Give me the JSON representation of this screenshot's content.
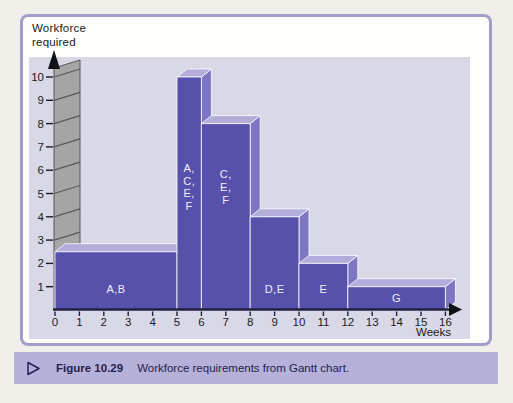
{
  "colors": {
    "page_bg": "#f1efe9",
    "card_bg": "#fdfdfb",
    "card_border": "#a29dca",
    "plot_bg": "#d9d8e7",
    "bar_front": "#5851ac",
    "bar_top": "#b2adda",
    "bar_side": "#7d76c3",
    "bar_label": "#f0eefc",
    "axis_line": "#21203f",
    "text": "#1b1b22",
    "wall_fill": "#a5a5a6",
    "wall_line": "#59595c",
    "caption_band_bg": "#b6b1d8",
    "caption_text": "#232250"
  },
  "chart": {
    "y_axis_title_line1": "Workforce",
    "y_axis_title_line2": "required"
  },
  "chart_data": {
    "type": "bar",
    "style": "3d-stepped-histogram",
    "title": "Workforce requirements from Gantt chart",
    "xlabel": "Weeks",
    "ylabel": "Workforce required",
    "xlim": [
      0,
      16
    ],
    "ylim": [
      0,
      10
    ],
    "x_ticks": [
      0,
      1,
      2,
      3,
      4,
      5,
      6,
      7,
      8,
      9,
      10,
      11,
      12,
      13,
      14,
      15,
      16
    ],
    "y_ticks": [
      1,
      2,
      3,
      4,
      5,
      6,
      7,
      8,
      9,
      10
    ],
    "grid": false,
    "legend": "none",
    "bars": [
      {
        "activities": "A,B",
        "start_week": 0,
        "end_week": 5,
        "workforce": 2.5,
        "label_layout": "inline"
      },
      {
        "activities": "A, C, E, F",
        "start_week": 5,
        "end_week": 6,
        "workforce": 10,
        "label_layout": "stacked"
      },
      {
        "activities": "C, E, F",
        "start_week": 6,
        "end_week": 8,
        "workforce": 8,
        "label_layout": "stacked"
      },
      {
        "activities": "D,E",
        "start_week": 8,
        "end_week": 10,
        "workforce": 4,
        "label_layout": "inline"
      },
      {
        "activities": "E",
        "start_week": 10,
        "end_week": 12,
        "workforce": 2,
        "label_layout": "inline"
      },
      {
        "activities": "G",
        "start_week": 12,
        "end_week": 16,
        "workforce": 1,
        "label_layout": "inline"
      }
    ]
  },
  "caption": {
    "marker": "triangle-right",
    "figure_label": "Figure 10.29",
    "text": "Workforce requirements from Gantt chart."
  }
}
